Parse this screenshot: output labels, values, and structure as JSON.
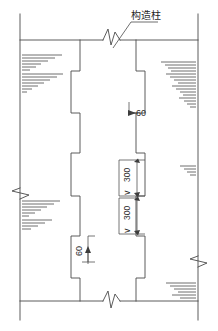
{
  "drawing": {
    "kind": "construction-detail-elevation",
    "width": 218,
    "height": 331,
    "background_color": "#ffffff",
    "line_color": "#4a4a4a",
    "text_color": "#2b2b2b",
    "annotations": {
      "column_label": "构造柱",
      "top_gap_label": "60",
      "bottom_gap_label": "60",
      "course_upper_label": "300",
      "course_lower_label": "300",
      "compare_symbol_upper": "∨",
      "compare_symbol_lower": "∨"
    },
    "labels": {
      "column_label_name": "constructional-column-callout",
      "top_dim_name": "top-joint-dimension",
      "bottom_dim_name": "bottom-joint-dimension",
      "upper_course_name": "upper-course-dimension",
      "lower_course_name": "lower-course-dimension"
    },
    "geometry": {
      "frame_left_x": 20,
      "frame_right_x": 198,
      "frame_top_y": 40,
      "frame_bottom_y": 301,
      "column_left_x": 80,
      "column_right_x": 136,
      "column_step_offset": 9
    }
  }
}
